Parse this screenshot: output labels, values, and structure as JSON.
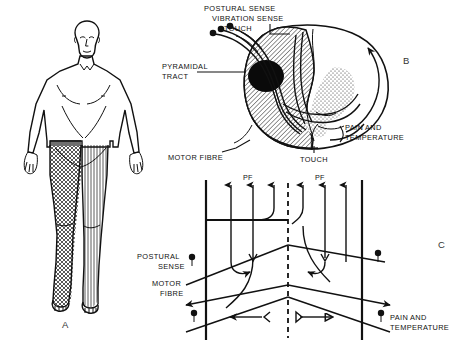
{
  "figure": {
    "panels": [
      {
        "id": "A",
        "letter": "A",
        "name": "body-diagram"
      },
      {
        "id": "B",
        "letter": "B",
        "name": "spinal-cord-cross-section"
      },
      {
        "id": "C",
        "letter": "C",
        "name": "fibre-pathway-schematic"
      }
    ]
  },
  "panel_a": {
    "letter": "A",
    "regions": [
      {
        "name": "left-leg",
        "pattern": "cross-hatch"
      },
      {
        "name": "right-leg",
        "pattern": "vertical-lines"
      },
      {
        "name": "waist-band",
        "pattern": "solid-gray"
      }
    ]
  },
  "panel_b": {
    "letter": "B",
    "labels": {
      "postural_sense": "POSTURAL SENSE",
      "vibration_sense": "VIBRATION SENSE",
      "touch_top": "TOUCH",
      "pyramidal_tract_line1": "PYRAMIDAL",
      "pyramidal_tract_line2": "TRACT",
      "motor_fibre": "MOTOR FIBRE",
      "touch_bottom": "TOUCH",
      "pain_and": "PAIN AND",
      "temperature": "TEMPERATURE"
    }
  },
  "panel_c": {
    "letter": "C",
    "labels": {
      "pf_left": "PF",
      "pf_right": "PF",
      "postural": "POSTURAL",
      "sense": "SENSE",
      "motor": "MOTOR",
      "fibre": "FIBRE",
      "pain_and": "PAIN AND",
      "temperature": "TEMPERATURE"
    }
  },
  "colors": {
    "ink": "#111111",
    "hatch_gray": "#8a8a8a",
    "band_gray": "#6f6f6f",
    "panel_letter": "#333333",
    "background": "#ffffff"
  }
}
